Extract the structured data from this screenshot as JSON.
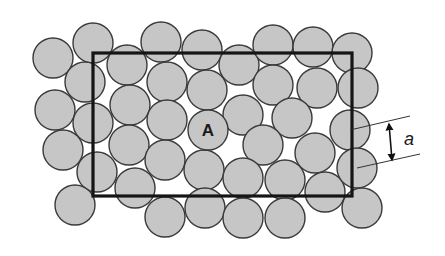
{
  "diagram": {
    "type": "particle-packing",
    "label_center_particle": "A",
    "label_dimension": "a",
    "colors": {
      "particle_fill": "#c6c6c6",
      "particle_stroke": "#3a3a3a",
      "frame": "#151515",
      "background": "#ffffff"
    },
    "frame": {
      "x": 93,
      "y": 53,
      "width": 259,
      "height": 143
    },
    "particle_radius": 20,
    "particles": [
      [
        53,
        58
      ],
      [
        93,
        43
      ],
      [
        85,
        82
      ],
      [
        55,
        110
      ],
      [
        127,
        65
      ],
      [
        161,
        42
      ],
      [
        202,
        50
      ],
      [
        167,
        82
      ],
      [
        130,
        105
      ],
      [
        207,
        90
      ],
      [
        239,
        65
      ],
      [
        273,
        45
      ],
      [
        313,
        47
      ],
      [
        352,
        53
      ],
      [
        273,
        85
      ],
      [
        317,
        88
      ],
      [
        243,
        115
      ],
      [
        292,
        118
      ],
      [
        167,
        120
      ],
      [
        93,
        123
      ],
      [
        63,
        150
      ],
      [
        129,
        145
      ],
      [
        165,
        160
      ],
      [
        204,
        170
      ],
      [
        263,
        145
      ],
      [
        315,
        153
      ],
      [
        97,
        172
      ],
      [
        135,
        188
      ],
      [
        75,
        205
      ],
      [
        243,
        178
      ],
      [
        285,
        180
      ],
      [
        325,
        192
      ],
      [
        358,
        88
      ],
      [
        350,
        130
      ],
      [
        357,
        168
      ],
      [
        362,
        208
      ],
      [
        165,
        217
      ],
      [
        205,
        208
      ],
      [
        243,
        218
      ],
      [
        285,
        218
      ]
    ],
    "labeled_particle": [
      208,
      130
    ],
    "dimension": {
      "leader1": [
        [
          350,
          130
        ],
        [
          410,
          116
        ]
      ],
      "leader2": [
        [
          357,
          168
        ],
        [
          420,
          154
        ]
      ],
      "arrow": [
        [
          389,
          124
        ],
        [
          392,
          160
        ]
      ],
      "text_pos": [
        404,
        145
      ]
    }
  }
}
